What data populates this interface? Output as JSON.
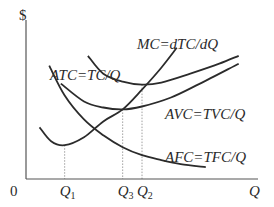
{
  "chart_data": {
    "type": "line",
    "title": "",
    "ylabel": "$",
    "xlabel": "Q",
    "origin_label": "0",
    "x_ticks": [
      {
        "name": "Q",
        "sub": "1",
        "x": 2.0
      },
      {
        "name": "Q",
        "sub": "3",
        "x": 5.0
      },
      {
        "name": "Q",
        "sub": "2",
        "x": 6.0
      }
    ],
    "xlim": [
      0,
      12
    ],
    "ylim": [
      0,
      8
    ],
    "series": [
      {
        "name": "MC",
        "label": "MC=dTC/dQ",
        "points": [
          [
            0.7,
            2.6
          ],
          [
            1.3,
            1.9
          ],
          [
            2.0,
            1.7
          ],
          [
            3.0,
            2.1
          ],
          [
            4.0,
            2.9
          ],
          [
            5.0,
            3.5
          ],
          [
            6.0,
            4.5
          ],
          [
            7.0,
            5.6
          ],
          [
            7.8,
            6.6
          ]
        ]
      },
      {
        "name": "ATC",
        "label": "ATC=TC/Q",
        "points": [
          [
            3.2,
            6.2
          ],
          [
            4.0,
            5.3
          ],
          [
            5.0,
            4.9
          ],
          [
            6.0,
            4.75
          ],
          [
            7.0,
            4.85
          ],
          [
            8.5,
            5.3
          ],
          [
            10.0,
            5.8
          ],
          [
            11.0,
            6.2
          ]
        ]
      },
      {
        "name": "AVC",
        "label": "AVC=TVC/Q",
        "points": [
          [
            1.8,
            4.8
          ],
          [
            3.0,
            3.9
          ],
          [
            4.0,
            3.6
          ],
          [
            5.0,
            3.5
          ],
          [
            6.0,
            3.65
          ],
          [
            7.5,
            4.1
          ],
          [
            9.0,
            4.8
          ],
          [
            11.0,
            5.8
          ]
        ]
      },
      {
        "name": "AFC",
        "label": "AFC=TFC/Q",
        "points": [
          [
            1.2,
            5.7
          ],
          [
            2.0,
            4.2
          ],
          [
            3.0,
            3.0
          ],
          [
            4.0,
            2.2
          ],
          [
            5.0,
            1.6
          ],
          [
            6.0,
            1.2
          ],
          [
            7.0,
            0.95
          ],
          [
            8.0,
            0.75
          ],
          [
            9.3,
            0.6
          ]
        ]
      }
    ],
    "annotations": [
      {
        "text": "ATC=TC/Q",
        "attached_to": "ATC"
      },
      {
        "text": "MC=dTC/dQ",
        "attached_to": "MC"
      },
      {
        "text": "AVC=TVC/Q",
        "attached_to": "AVC"
      },
      {
        "text": "AFC=TFC/Q",
        "attached_to": "AFC"
      }
    ],
    "guides": [
      {
        "from": "MC minimum",
        "at_tick": "Q1"
      },
      {
        "from": "MC ∩ AVC (AVC minimum)",
        "at_tick": "Q3"
      },
      {
        "from": "MC ∩ ATC (ATC minimum)",
        "at_tick": "Q2"
      }
    ],
    "grid": false,
    "legend": "none"
  }
}
